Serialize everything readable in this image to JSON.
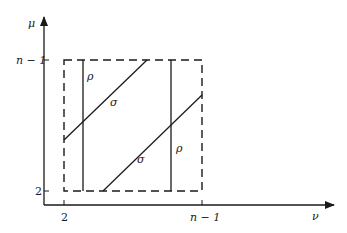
{
  "diagram": {
    "axes": {
      "y_label": "μ",
      "x_label": "ν",
      "y_ticks": [
        {
          "label": "n − 1",
          "position": "top"
        },
        {
          "label": "2",
          "position": "bottom"
        }
      ],
      "x_ticks": [
        {
          "label": "2",
          "position": "left"
        },
        {
          "label": "n − 1",
          "position": "right"
        }
      ]
    },
    "region": {
      "description": "Dashed square from 2 to n−1 on both axes",
      "style": "dashed"
    },
    "lines": [
      {
        "type": "vertical",
        "label": "ρ"
      },
      {
        "type": "vertical",
        "label": "ρ"
      },
      {
        "type": "diagonal",
        "label": "σ"
      },
      {
        "type": "diagonal",
        "label": "σ"
      }
    ],
    "colors": {
      "stroke": "#1a1a1a",
      "background": "#ffffff"
    }
  }
}
